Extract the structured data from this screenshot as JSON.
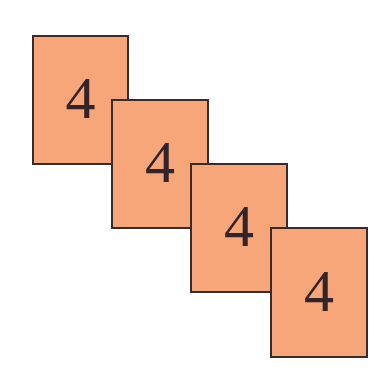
{
  "diagram": {
    "colors": {
      "card_fill": "#f6a679",
      "card_border": "#3b2a2a",
      "digit": "#33242a",
      "background": "#ffffff"
    },
    "cards": [
      {
        "label": "4",
        "x": 32,
        "y": 35,
        "width": 97,
        "height": 130
      },
      {
        "label": "4",
        "x": 111,
        "y": 99,
        "width": 98,
        "height": 130
      },
      {
        "label": "4",
        "x": 190,
        "y": 163,
        "width": 98,
        "height": 130
      },
      {
        "label": "4",
        "x": 270,
        "y": 227,
        "width": 98,
        "height": 131
      }
    ]
  }
}
